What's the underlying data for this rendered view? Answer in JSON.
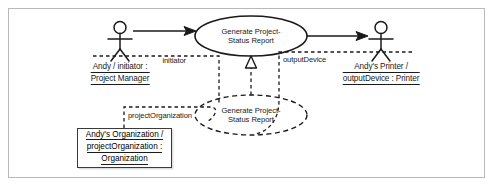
{
  "diagram": {
    "type": "uml-use-case-instance-diagram",
    "background_color": "#ffffff",
    "line_color": "#1a1a1a",
    "frame_color": "#b9b9b9",
    "actors": [
      {
        "id": "initiator-actor",
        "name_line1": "Andy / initiator :",
        "name_line2": "Project Manager",
        "x": 120,
        "y": 40
      },
      {
        "id": "printer-actor",
        "name_line1": "Andy's Printer /",
        "name_line2": "outputDevice : Printer",
        "x": 381,
        "y": 40
      }
    ],
    "use_cases": [
      {
        "id": "use-case-solid",
        "line1": "Generate Project-",
        "line2": "Status Report",
        "style": "solid",
        "cx": 251,
        "cy": 36,
        "rx": 56,
        "ry": 20
      },
      {
        "id": "use-case-dashed",
        "line1": "Generate Project-",
        "line2": "Status Report",
        "style": "dashed",
        "cx": 251,
        "cy": 115,
        "rx": 56,
        "ry": 20
      }
    ],
    "object_box": {
      "id": "organization-object",
      "line1": "Andy's Organization /",
      "line2": "projectOrganization :",
      "line3": "Organization"
    },
    "role_labels": [
      {
        "id": "initiator-role",
        "text": "initiator",
        "x": 186,
        "y": 61
      },
      {
        "id": "output-device-role",
        "text": "outputDevice",
        "x": 281,
        "y": 60
      },
      {
        "id": "project-organization-role",
        "text": "projectOrganization",
        "x": 124,
        "y": 115
      }
    ],
    "connectors": [
      {
        "id": "initiator-association",
        "style": "solid-arrow",
        "from": "initiator-actor",
        "to": "use-case-solid"
      },
      {
        "id": "output-association",
        "style": "solid-arrow",
        "from": "use-case-solid",
        "to": "printer-actor"
      },
      {
        "id": "realization",
        "style": "dashed-hollow-triangle",
        "from": "use-case-dashed",
        "to": "use-case-solid"
      },
      {
        "id": "initiator-link",
        "style": "dashed",
        "from": "initiator-actor",
        "to": "use-case-dashed"
      },
      {
        "id": "output-link",
        "style": "dashed",
        "from": "printer-actor",
        "to": "use-case-dashed"
      },
      {
        "id": "organization-link",
        "style": "dashed",
        "from": "organization-object",
        "to": "use-case-dashed"
      }
    ]
  }
}
